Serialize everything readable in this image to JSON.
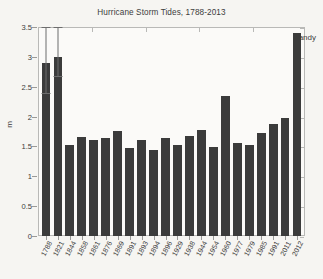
{
  "chart_data": {
    "type": "bar",
    "title": "Hurricane Storm Tides, 1788-2013",
    "xlabel": "",
    "ylabel": "m",
    "ylim": [
      0,
      3.5
    ],
    "yticks": [
      0,
      0.5,
      1,
      1.5,
      2,
      2.5,
      3,
      3.5
    ],
    "ytick_labels": [
      "0",
      "0.5",
      "1",
      "1.5",
      "2",
      "2.5",
      "3",
      "3.5"
    ],
    "grid": false,
    "legend": null,
    "categories": [
      "1788",
      "1821",
      "1844",
      "1858",
      "1861",
      "1876",
      "1869",
      "1891",
      "1893",
      "1894",
      "1896",
      "1929",
      "1938",
      "1944",
      "1954",
      "1960",
      "1977",
      "1979",
      "1985",
      "1991",
      "2011",
      "2012"
    ],
    "values": [
      2.9,
      3.0,
      1.52,
      1.65,
      1.61,
      1.64,
      1.76,
      1.48,
      1.6,
      1.44,
      1.64,
      1.53,
      1.68,
      1.77,
      1.49,
      2.34,
      1.56,
      1.53,
      1.72,
      1.88,
      1.98,
      3.4
    ],
    "error_bars": [
      {
        "category": "1788",
        "index": 0,
        "low": 2.4,
        "high": 3.5
      },
      {
        "category": "1821",
        "index": 1,
        "low": 2.68,
        "high": 3.5
      }
    ],
    "annotations": [
      {
        "text": "Sandy",
        "category": "2012",
        "position": "above-bar-right"
      }
    ],
    "bar_color": "#3b3b3b",
    "error_bar_color": "#6d6d6d",
    "background_color": "#f6f5f2",
    "axes_color": "#b9b9b7"
  }
}
